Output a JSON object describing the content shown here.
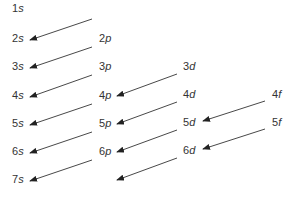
{
  "diagram": {
    "color": "#333333",
    "orbitals": [
      {
        "n": "1",
        "l": "s",
        "x": 12,
        "y": 8
      },
      {
        "n": "2",
        "l": "s",
        "x": 12,
        "y": 38
      },
      {
        "n": "3",
        "l": "s",
        "x": 12,
        "y": 66
      },
      {
        "n": "4",
        "l": "s",
        "x": 12,
        "y": 95
      },
      {
        "n": "5",
        "l": "s",
        "x": 12,
        "y": 123
      },
      {
        "n": "6",
        "l": "s",
        "x": 12,
        "y": 151
      },
      {
        "n": "7",
        "l": "s",
        "x": 12,
        "y": 179
      },
      {
        "n": "2",
        "l": "p",
        "x": 99,
        "y": 38
      },
      {
        "n": "3",
        "l": "p",
        "x": 99,
        "y": 66
      },
      {
        "n": "4",
        "l": "p",
        "x": 99,
        "y": 95
      },
      {
        "n": "5",
        "l": "p",
        "x": 99,
        "y": 123
      },
      {
        "n": "6",
        "l": "p",
        "x": 99,
        "y": 151
      },
      {
        "n": "3",
        "l": "d",
        "x": 183,
        "y": 66
      },
      {
        "n": "4",
        "l": "d",
        "x": 183,
        "y": 94
      },
      {
        "n": "5",
        "l": "d",
        "x": 183,
        "y": 122
      },
      {
        "n": "6",
        "l": "d",
        "x": 183,
        "y": 150
      },
      {
        "n": "4",
        "l": "f",
        "x": 272,
        "y": 94
      },
      {
        "n": "5",
        "l": "f",
        "x": 272,
        "y": 122
      }
    ],
    "arrows": [
      {
        "x1": 92,
        "y1": 19,
        "x2": 30,
        "y2": 40
      },
      {
        "x1": 92,
        "y1": 47,
        "x2": 30,
        "y2": 68
      },
      {
        "x1": 92,
        "y1": 75,
        "x2": 30,
        "y2": 97
      },
      {
        "x1": 92,
        "y1": 104,
        "x2": 30,
        "y2": 125
      },
      {
        "x1": 92,
        "y1": 132,
        "x2": 30,
        "y2": 153
      },
      {
        "x1": 92,
        "y1": 160,
        "x2": 30,
        "y2": 181
      },
      {
        "x1": 177,
        "y1": 74,
        "x2": 117,
        "y2": 96
      },
      {
        "x1": 177,
        "y1": 102,
        "x2": 117,
        "y2": 124
      },
      {
        "x1": 177,
        "y1": 130,
        "x2": 117,
        "y2": 152
      },
      {
        "x1": 177,
        "y1": 158,
        "x2": 117,
        "y2": 180
      },
      {
        "x1": 265,
        "y1": 101,
        "x2": 203,
        "y2": 121
      },
      {
        "x1": 265,
        "y1": 129,
        "x2": 203,
        "y2": 149
      }
    ]
  }
}
